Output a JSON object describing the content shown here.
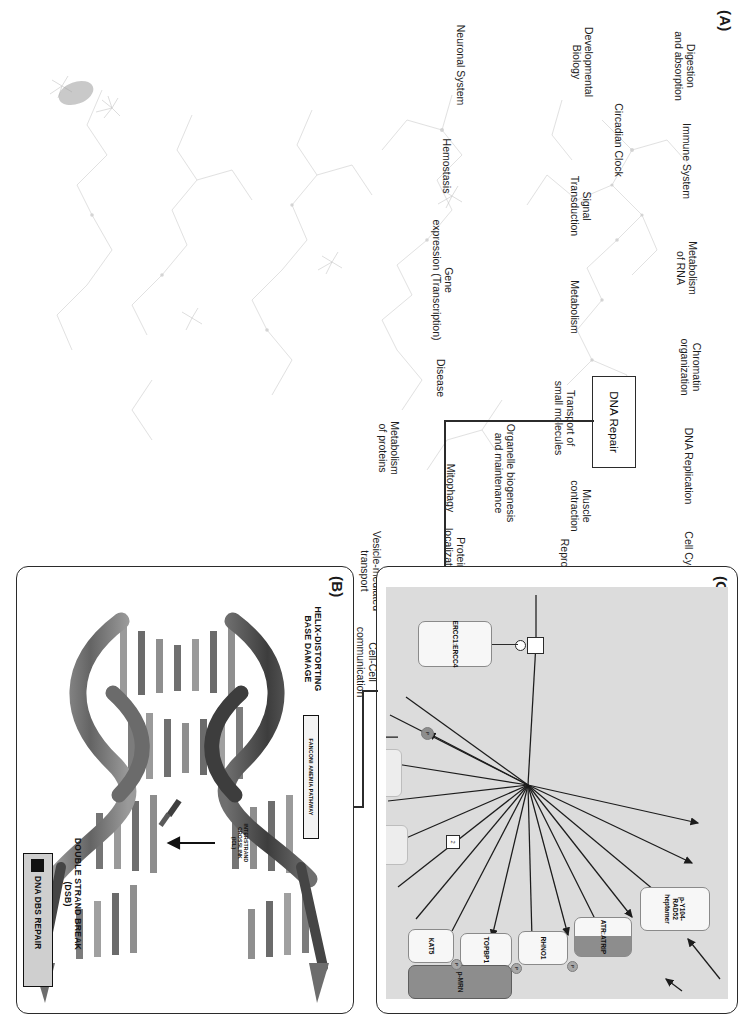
{
  "figure": {
    "panels": [
      "A",
      "B",
      "C"
    ]
  },
  "panelA": {
    "letter": "(A)",
    "highlighted_node": "DNA Repair",
    "pathway_labels": [
      "Digestion\nand absorption",
      "Immune System",
      "Metabolism\nof RNA",
      "Chromatin\norganization",
      "DNA Replication",
      "Cell Cycle",
      "Programmed\nCell Death",
      "Circadian Clock",
      "Developmental\nBiology",
      "Signal\nTransduction",
      "Metabolism",
      "Transport of\nsmall molecules",
      "Muscle\ncontraction",
      "Organelle biogenesis\nand maintenance",
      "Reproduction",
      "Cellular responses\nto external stimuli",
      "Mitophagy",
      "Protein\nlocalization",
      "Extracellular\nmatrix organization",
      "Neuronal System",
      "Hemostasis",
      "Gene\nexpression (Transcription)",
      "Disease",
      "Metabolism\nof proteins",
      "Vesicle-mediated\ntransport",
      "Cell-Cell\ncommunication"
    ]
  },
  "panelB": {
    "letter": "(B)",
    "captions": [
      "HELIX-DISTORTING\nBASE DAMAGE",
      "DOUBLE STRAND BREAK\n(DSB)"
    ],
    "pathway_tag": "FANCONI ANEMIA PATHWAY",
    "crosslink_label": "INTERSTRAND\nCROSSLINK\n(ICL)",
    "repair_box_label": "DNA DBS REPAIR"
  },
  "panelC": {
    "letter": "(C)",
    "nodes": [
      {
        "id": "rad52",
        "label": "p-Y104-RAD52\nheptamer",
        "style": "light"
      },
      {
        "id": "atratrip",
        "label": "ATR:ATRIP",
        "style": "half"
      },
      {
        "id": "rhno1",
        "label": "RHNO1",
        "style": "light"
      },
      {
        "id": "topbp1",
        "label": "TOPBP1",
        "style": "light"
      },
      {
        "id": "kat5",
        "label": "KAT5",
        "style": "light"
      },
      {
        "id": "pmrn",
        "label": "p-MRN",
        "style": "dark"
      },
      {
        "id": "ercc",
        "label": "ERCC1:ERCC4",
        "style": "light"
      }
    ],
    "stoichiometry_label": "2",
    "badges": [
      "P",
      "P",
      "P",
      "P"
    ]
  }
}
